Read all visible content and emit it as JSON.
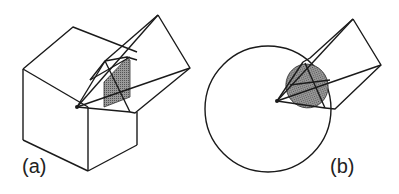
{
  "figure": {
    "panels": [
      {
        "id": "a",
        "label": "(a)",
        "description": "view frustum from apex intersecting a cube, shaded cross-section"
      },
      {
        "id": "b",
        "label": "(b)",
        "description": "view frustum from apex intersecting a sphere, shaded elliptical cross-section"
      }
    ],
    "colors": {
      "stroke": "#1a1a1a",
      "shade": "#7a7a7a",
      "background": "#ffffff"
    }
  }
}
